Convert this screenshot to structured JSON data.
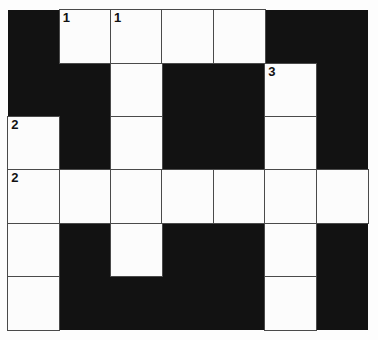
{
  "puzzle": {
    "title": "Crossword Grid",
    "rows": 6,
    "columns": 7,
    "colors": {
      "block": "#121212",
      "cell": "#fcfcfc",
      "grid_line": "#4a4a4a",
      "number": "#111111",
      "page_background": "#fdfdfd"
    },
    "cells": [
      [
        {
          "state": "black",
          "number": ""
        },
        {
          "state": "white",
          "number": "1"
        },
        {
          "state": "white",
          "number": "1"
        },
        {
          "state": "white",
          "number": ""
        },
        {
          "state": "white",
          "number": ""
        },
        {
          "state": "black",
          "number": ""
        },
        {
          "state": "black",
          "number": ""
        }
      ],
      [
        {
          "state": "black",
          "number": ""
        },
        {
          "state": "black",
          "number": ""
        },
        {
          "state": "white",
          "number": ""
        },
        {
          "state": "black",
          "number": ""
        },
        {
          "state": "black",
          "number": ""
        },
        {
          "state": "white",
          "number": "3"
        },
        {
          "state": "black",
          "number": ""
        }
      ],
      [
        {
          "state": "white",
          "number": "2"
        },
        {
          "state": "black",
          "number": ""
        },
        {
          "state": "white",
          "number": ""
        },
        {
          "state": "black",
          "number": ""
        },
        {
          "state": "black",
          "number": ""
        },
        {
          "state": "white",
          "number": ""
        },
        {
          "state": "black",
          "number": ""
        }
      ],
      [
        {
          "state": "white",
          "number": "2"
        },
        {
          "state": "white",
          "number": ""
        },
        {
          "state": "white",
          "number": ""
        },
        {
          "state": "white",
          "number": ""
        },
        {
          "state": "white",
          "number": ""
        },
        {
          "state": "white",
          "number": ""
        },
        {
          "state": "white",
          "number": ""
        }
      ],
      [
        {
          "state": "white",
          "number": ""
        },
        {
          "state": "black",
          "number": ""
        },
        {
          "state": "white",
          "number": ""
        },
        {
          "state": "black",
          "number": ""
        },
        {
          "state": "black",
          "number": ""
        },
        {
          "state": "white",
          "number": ""
        },
        {
          "state": "black",
          "number": ""
        }
      ],
      [
        {
          "state": "white",
          "number": ""
        },
        {
          "state": "black",
          "number": ""
        },
        {
          "state": "black",
          "number": ""
        },
        {
          "state": "black",
          "number": ""
        },
        {
          "state": "black",
          "number": ""
        },
        {
          "state": "white",
          "number": ""
        },
        {
          "state": "black",
          "number": ""
        }
      ]
    ]
  }
}
